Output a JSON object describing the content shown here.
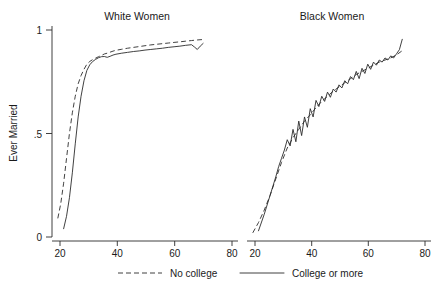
{
  "chart_data": {
    "type": "line",
    "title": "",
    "ylabel": "Ever Married",
    "xlabel": "",
    "ylim": [
      0,
      1
    ],
    "yticks": [
      "0",
      ".5",
      "1"
    ],
    "ytick_values": [
      0,
      0.5,
      1
    ],
    "grid": false,
    "legend_position": "bottom",
    "legend": [
      {
        "label": "No college",
        "style": "dashed"
      },
      {
        "label": "College or more",
        "style": "solid"
      }
    ],
    "panels": [
      {
        "title": "White Women",
        "xlabel": "",
        "xlim": [
          18,
          82
        ],
        "xticks": [
          "20",
          "40",
          "60",
          "80"
        ],
        "xtick_values": [
          20,
          40,
          60,
          80
        ],
        "series": [
          {
            "name": "No college",
            "style": "dashed",
            "x": [
              20,
              21,
              22,
              23,
              24,
              25,
              26,
              27,
              28,
              29,
              30,
              31,
              32,
              33,
              34,
              35,
              36,
              37,
              38,
              39,
              40,
              42,
              44,
              46,
              48,
              50,
              52,
              54,
              56,
              58,
              60,
              62,
              64,
              66,
              68,
              70
            ],
            "y": [
              0.09,
              0.16,
              0.26,
              0.38,
              0.5,
              0.6,
              0.68,
              0.74,
              0.78,
              0.81,
              0.835,
              0.848,
              0.857,
              0.864,
              0.871,
              0.877,
              0.884,
              0.888,
              0.893,
              0.898,
              0.902,
              0.907,
              0.912,
              0.916,
              0.92,
              0.924,
              0.928,
              0.931,
              0.934,
              0.937,
              0.94,
              0.943,
              0.946,
              0.949,
              0.952,
              0.954
            ]
          },
          {
            "name": "College or more",
            "style": "solid",
            "x": [
              22,
              23,
              24,
              25,
              26,
              27,
              28,
              29,
              30,
              31,
              32,
              33,
              34,
              35,
              36,
              37,
              38,
              39,
              40,
              42,
              44,
              46,
              48,
              50,
              52,
              54,
              56,
              58,
              60,
              62,
              64,
              66,
              67,
              68,
              69,
              70
            ],
            "y": [
              0.04,
              0.1,
              0.19,
              0.31,
              0.45,
              0.58,
              0.68,
              0.755,
              0.805,
              0.832,
              0.848,
              0.858,
              0.866,
              0.871,
              0.872,
              0.868,
              0.873,
              0.879,
              0.883,
              0.888,
              0.892,
              0.896,
              0.899,
              0.903,
              0.906,
              0.909,
              0.912,
              0.916,
              0.919,
              0.922,
              0.926,
              0.929,
              0.918,
              0.906,
              0.922,
              0.935
            ]
          }
        ]
      },
      {
        "title": "Black Women",
        "xlabel": "",
        "xlim": [
          18,
          82
        ],
        "xticks": [
          "20",
          "40",
          "60",
          "80"
        ],
        "xtick_values": [
          20,
          40,
          60,
          80
        ],
        "series": [
          {
            "name": "No college",
            "style": "dashed",
            "x": [
              20,
              22,
              24,
              26,
              28,
              30,
              32,
              34,
              36,
              38,
              40,
              42,
              44,
              46,
              48,
              50,
              52,
              54,
              56,
              58,
              60,
              62,
              64,
              66,
              68,
              70,
              72
            ],
            "y": [
              0.02,
              0.07,
              0.13,
              0.2,
              0.28,
              0.36,
              0.43,
              0.48,
              0.52,
              0.56,
              0.59,
              0.625,
              0.655,
              0.68,
              0.705,
              0.725,
              0.745,
              0.765,
              0.785,
              0.8,
              0.815,
              0.83,
              0.845,
              0.855,
              0.865,
              0.88,
              0.9
            ]
          },
          {
            "name": "College or more",
            "style": "solid",
            "x": [
              22,
              24,
              26,
              28,
              29,
              30,
              31,
              32,
              33,
              34,
              35,
              36,
              37,
              38,
              39,
              40,
              41,
              42,
              43,
              44,
              45,
              46,
              47,
              48,
              49,
              50,
              51,
              52,
              53,
              54,
              55,
              56,
              57,
              58,
              59,
              60,
              61,
              62,
              63,
              64,
              65,
              66,
              67,
              68,
              69,
              70,
              71,
              72
            ],
            "y": [
              0.03,
              0.11,
              0.2,
              0.29,
              0.34,
              0.38,
              0.42,
              0.47,
              0.44,
              0.52,
              0.46,
              0.56,
              0.49,
              0.58,
              0.53,
              0.62,
              0.58,
              0.66,
              0.63,
              0.68,
              0.655,
              0.7,
              0.675,
              0.715,
              0.7,
              0.735,
              0.72,
              0.755,
              0.74,
              0.775,
              0.76,
              0.8,
              0.765,
              0.815,
              0.79,
              0.835,
              0.81,
              0.845,
              0.83,
              0.855,
              0.845,
              0.865,
              0.855,
              0.875,
              0.865,
              0.885,
              0.905,
              0.955
            ]
          }
        ]
      }
    ]
  },
  "figure": {
    "ylabel": "Ever Married",
    "panel_left_title": "White Women",
    "panel_right_title": "Black Women",
    "ytick_1": "1",
    "ytick_half": ".5",
    "ytick_0": "0",
    "left_xtick_20": "20",
    "left_xtick_40": "40",
    "left_xtick_60": "60",
    "left_xtick_80": "80",
    "right_xtick_20": "20",
    "right_xtick_40": "40",
    "right_xtick_60": "60",
    "right_xtick_80": "80",
    "legend_no_college": "No college",
    "legend_college_or_more": "College or more"
  }
}
